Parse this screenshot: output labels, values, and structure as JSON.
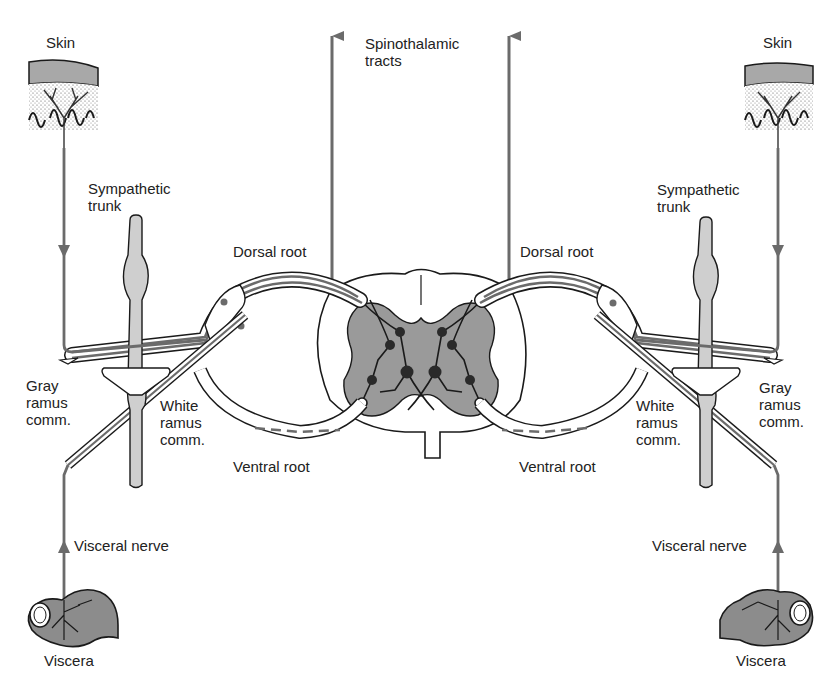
{
  "diagram": {
    "type": "anatomical-illustration",
    "colors": {
      "line": "#1a1a1a",
      "nerve_gray": "#6b6b6b",
      "gray_matter": "#9a9a9a",
      "trunk_fill": "#cfcfcf",
      "skin_band": "#a8a8a8",
      "viscera_fill": "#8c8c8c",
      "background": "#ffffff"
    },
    "labels": {
      "spinothalamic": "Spinothalamic\ntracts",
      "left": {
        "skin": "Skin",
        "sympathetic_trunk": "Sympathetic\ntrunk",
        "dorsal_root": "Dorsal root",
        "gray_ramus": "Gray\nramus\ncomm.",
        "white_ramus": "White\nramus\ncomm.",
        "ventral_root": "Ventral root",
        "visceral_nerve": "Visceral nerve",
        "viscera": "Viscera"
      },
      "right": {
        "skin": "Skin",
        "sympathetic_trunk": "Sympathetic\ntrunk",
        "dorsal_root": "Dorsal root",
        "gray_ramus": "Gray\nramus\ncomm.",
        "white_ramus": "White\nramus\ncomm.",
        "ventral_root": "Ventral root",
        "visceral_nerve": "Visceral nerve",
        "viscera": "Viscera"
      }
    }
  }
}
